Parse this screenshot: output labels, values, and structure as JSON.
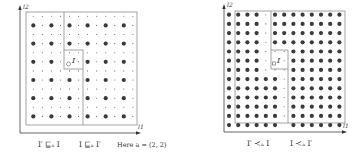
{
  "figure": {
    "left_panel": {
      "y_axis_label": "l2",
      "x_axis_label": "l1",
      "region_label": "I",
      "caption_left": "I′ ⊑ₐ I",
      "caption_right": "I ⊑ₐ I′",
      "note": "Here a = (2, 2)",
      "grid": {
        "cols": 12,
        "rows": 12,
        "large_dot_rule": "every 2nd column and row"
      }
    },
    "right_panel": {
      "y_axis_label": "l2",
      "x_axis_label": "l1",
      "region_label": "I",
      "caption_left": "I′ ≺ₐ I",
      "caption_right": "I ≺ₐ I′",
      "grid": {
        "cols": 13,
        "rows": 13
      }
    },
    "colors": {
      "dot": "#3a3a3a",
      "box": "#9a9a9a",
      "axis": "#555555"
    }
  }
}
